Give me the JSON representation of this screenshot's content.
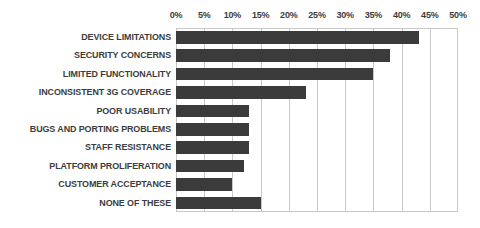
{
  "chart_data": {
    "type": "bar",
    "orientation": "horizontal",
    "title": "",
    "subtitle": "",
    "xlabel": "",
    "ylabel": "",
    "xlim": [
      0,
      50
    ],
    "grid": true,
    "legend": null,
    "tick_labels": [
      "0%",
      "5%",
      "10%",
      "15%",
      "20%",
      "25%",
      "30%",
      "35%",
      "40%",
      "45%",
      "50%"
    ],
    "tick_values": [
      0,
      5,
      10,
      15,
      20,
      25,
      30,
      35,
      40,
      45,
      50
    ],
    "categories": [
      "DEVICE LIMITATIONS",
      "SECURITY CONCERNS",
      "LIMITED FUNCTIONALITY",
      "INCONSISTENT 3G COVERAGE",
      "POOR USABILITY",
      "BUGS AND PORTING PROBLEMS",
      "STAFF RESISTANCE",
      "PLATFORM PROLIFERATION",
      "CUSTOMER ACCEPTANCE",
      "NONE OF THESE"
    ],
    "values": [
      43,
      38,
      35,
      23,
      13,
      13,
      13,
      12,
      10,
      15
    ]
  },
  "style": {
    "bar_color": "#3b3b3b",
    "grid_color": "#c8c8c8",
    "text_color": "#3c3c3c",
    "background": "#ffffff"
  }
}
